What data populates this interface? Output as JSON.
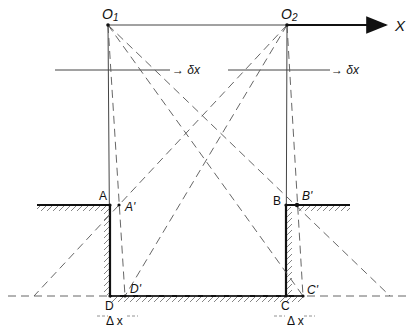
{
  "diagram": {
    "labels": {
      "o1": "O",
      "o1_sub": "1",
      "o2": "O",
      "o2_sub": "2",
      "x_axis": "X",
      "dx_left": "→ δx",
      "dx_right": "→ δx",
      "a": "A",
      "a_prime": "A'",
      "b": "B",
      "b_prime": "B'",
      "c": "C",
      "c_prime": "C'",
      "d": "D",
      "d_prime": "D'",
      "delta_x_left": "Δ x",
      "delta_x_right": "Δ x"
    },
    "colors": {
      "ink": "#111111",
      "thin": "#444444",
      "dash": "#555555"
    }
  }
}
